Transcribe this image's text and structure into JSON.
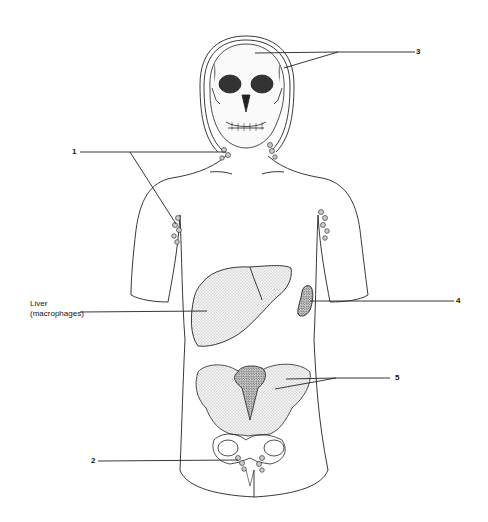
{
  "diagram": {
    "type": "anatomical-line-drawing"
  },
  "labels": [
    {
      "id": "1",
      "text": "1",
      "points_to": "cervical and axillary lymph nodes"
    },
    {
      "id": "2",
      "text": "2",
      "points_to": "inguinal lymph nodes"
    },
    {
      "id": "3",
      "text": "3",
      "points_to": "skull (bone marrow)"
    },
    {
      "id": "4",
      "text": "4",
      "points_to": "spleen"
    },
    {
      "id": "5",
      "text": "5",
      "points_to": "pelvis (bone marrow)"
    },
    {
      "id": "liver",
      "text_line1": "Liver",
      "text_line2": "(macrophages)",
      "points_to": "liver"
    }
  ],
  "colors": {
    "line": "#222222",
    "background": "#ffffff",
    "stipple": "#555555"
  }
}
